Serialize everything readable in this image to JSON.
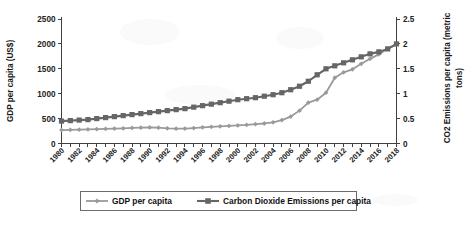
{
  "chart_data": {
    "type": "line",
    "title": "",
    "xlabel": "",
    "ylabel": "GDP per capita (US$)",
    "y2label": "CO2 Emissions per capita (metric tons)",
    "grid": false,
    "legend_position": "bottom",
    "ylim": [
      0,
      2500
    ],
    "y2lim": [
      0,
      2.5
    ],
    "yticks": [
      "0",
      "500",
      "1000",
      "1500",
      "2000",
      "2500"
    ],
    "y2ticks": [
      "0",
      "0.5",
      "1",
      "1.5",
      "2",
      "2.5"
    ],
    "x": [
      1980,
      1981,
      1982,
      1983,
      1984,
      1985,
      1986,
      1987,
      1988,
      1989,
      1990,
      1991,
      1992,
      1993,
      1994,
      1995,
      1996,
      1997,
      1998,
      1999,
      2000,
      2001,
      2002,
      2003,
      2004,
      2005,
      2006,
      2007,
      2008,
      2009,
      2010,
      2011,
      2012,
      2013,
      2014,
      2015,
      2016,
      2017,
      2018
    ],
    "xtick_labels": [
      "1980",
      "1982",
      "1984",
      "1986",
      "1988",
      "1990",
      "1992",
      "1994",
      "1996",
      "1998",
      "2000",
      "2002",
      "2004",
      "2006",
      "2008",
      "2010",
      "2012",
      "2014",
      "2016",
      "2018"
    ],
    "series": [
      {
        "name": "GDP per capita",
        "axis": "left",
        "marker": "diamond",
        "color": "#9a9a9a",
        "values": [
          270,
          275,
          278,
          282,
          288,
          295,
          300,
          305,
          312,
          318,
          322,
          318,
          305,
          298,
          300,
          310,
          322,
          335,
          345,
          352,
          362,
          372,
          388,
          402,
          425,
          470,
          540,
          660,
          820,
          880,
          1020,
          1320,
          1430,
          1490,
          1600,
          1700,
          1790,
          1900,
          1990
        ]
      },
      {
        "name": "Carbon Dioxide Emissions per capita",
        "axis": "right",
        "marker": "square",
        "color": "#666666",
        "values": [
          0.45,
          0.46,
          0.47,
          0.48,
          0.5,
          0.52,
          0.54,
          0.56,
          0.58,
          0.6,
          0.62,
          0.64,
          0.66,
          0.68,
          0.7,
          0.73,
          0.76,
          0.79,
          0.82,
          0.85,
          0.88,
          0.9,
          0.92,
          0.95,
          0.98,
          1.02,
          1.08,
          1.15,
          1.25,
          1.38,
          1.5,
          1.56,
          1.62,
          1.68,
          1.74,
          1.8,
          1.84,
          1.9,
          2.0
        ]
      }
    ],
    "legend": [
      {
        "label": "GDP per capita",
        "marker": "diamond",
        "color": "#9a9a9a"
      },
      {
        "label": "Carbon Dioxide Emissions per capita",
        "marker": "square",
        "color": "#666666"
      }
    ]
  }
}
